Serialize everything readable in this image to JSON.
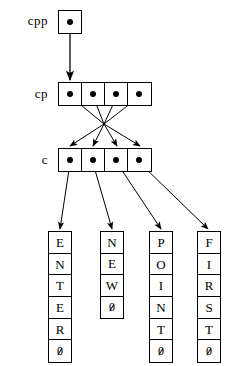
{
  "diagram": {
    "type": "pointer-memory-diagram",
    "colors": {
      "stroke": "#000000",
      "background": "#ffffff",
      "dot": "#000000"
    },
    "levels": [
      {
        "name": "cpp",
        "label": "cpp",
        "kind": "single-pointer-box",
        "cells": 1
      },
      {
        "name": "cp",
        "label": "cp",
        "kind": "pointer-array",
        "cells": 4
      },
      {
        "name": "c",
        "label": "c",
        "kind": "pointer-array",
        "cells": 4
      }
    ],
    "strings": [
      {
        "name": "string-enter",
        "text": "ENTER",
        "chars": [
          "E",
          "N",
          "T",
          "E",
          "R"
        ],
        "terminator": "0",
        "cells": 6
      },
      {
        "name": "string-new",
        "text": "NEW",
        "chars": [
          "N",
          "E",
          "W"
        ],
        "terminator": "0",
        "cells": 4
      },
      {
        "name": "string-point",
        "text": "POINT",
        "chars": [
          "P",
          "O",
          "I",
          "N",
          "T"
        ],
        "terminator": "0",
        "cells": 6
      },
      {
        "name": "string-first",
        "text": "FIRST",
        "chars": [
          "F",
          "I",
          "R",
          "S",
          "T"
        ],
        "terminator": "0",
        "cells": 6
      }
    ],
    "arrows": [
      {
        "name": "arrow-cpp-to-cp",
        "from": "cpp.cell0",
        "to": "cp.cell0"
      },
      {
        "name": "arrow-cp0-to-c",
        "from": "cp.cell0",
        "to": "c.cell0",
        "crosses": true
      },
      {
        "name": "arrow-cp1-to-c",
        "from": "cp.cell1",
        "to": "c.cell1",
        "crosses": true
      },
      {
        "name": "arrow-cp2-to-c",
        "from": "cp.cell2",
        "to": "c.cell2",
        "crosses": true
      },
      {
        "name": "arrow-cp3-to-c",
        "from": "cp.cell3",
        "to": "c.cell3",
        "crosses": true
      },
      {
        "name": "arrow-c0-to-enter",
        "from": "c.cell0",
        "to": "string-enter"
      },
      {
        "name": "arrow-c1-to-new",
        "from": "c.cell1",
        "to": "string-new"
      },
      {
        "name": "arrow-c2-to-point",
        "from": "c.cell2",
        "to": "string-point"
      },
      {
        "name": "arrow-c3-to-first",
        "from": "c.cell3",
        "to": "string-first"
      }
    ]
  }
}
